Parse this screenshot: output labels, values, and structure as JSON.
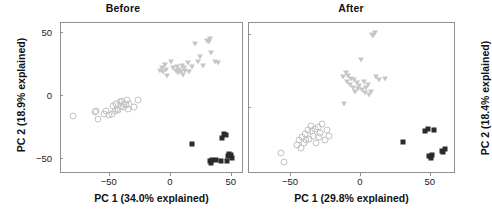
{
  "figure": {
    "width": 492,
    "height": 222,
    "background": "#ffffff",
    "marker_colors": {
      "circle_stroke": "#c2c2c2",
      "triangle_fill": "#c6c6c6",
      "square_fill": "#2b2b2b",
      "axis_line": "#8e8e8e",
      "text": "#111111"
    }
  },
  "chart_data": [
    {
      "type": "scatter",
      "title": "Before",
      "xlabel": "PC 1 (34.0% explained)",
      "ylabel": "PC 2 (18.9% explained)",
      "xlim": [
        -90,
        60
      ],
      "ylim": [
        -62,
        58
      ],
      "xticks": [
        -50,
        0,
        50
      ],
      "xticklabels": [
        "−50",
        "0",
        "50"
      ],
      "yticks": [
        -50,
        0,
        50
      ],
      "yticklabels": [
        "−50",
        "0",
        "50"
      ],
      "grid": false,
      "legend": "none",
      "series": [
        {
          "name": "group-circle",
          "marker": "circle-open",
          "color": "#c2c2c2",
          "points": [
            [
              -80,
              -16
            ],
            [
              -62,
              -13
            ],
            [
              -61,
              -12
            ],
            [
              -60,
              -18
            ],
            [
              -55,
              -14
            ],
            [
              -53,
              -12
            ],
            [
              -51,
              -15
            ],
            [
              -48,
              -14
            ],
            [
              -47,
              -8
            ],
            [
              -46,
              -12
            ],
            [
              -45,
              -6
            ],
            [
              -44,
              -10
            ],
            [
              -43,
              -11
            ],
            [
              -42,
              -5
            ],
            [
              -41,
              -8
            ],
            [
              -40,
              -4
            ],
            [
              -39,
              -9
            ],
            [
              -38,
              -6
            ],
            [
              -37,
              -7
            ],
            [
              -36,
              -3
            ],
            [
              -35,
              -10
            ],
            [
              -34,
              -6
            ],
            [
              -30,
              -9
            ],
            [
              -27,
              -3
            ]
          ]
        },
        {
          "name": "group-triangle",
          "marker": "triangle-down",
          "color": "#c6c6c6",
          "points": [
            [
              -9,
              20
            ],
            [
              -7,
              22
            ],
            [
              -6,
              19
            ],
            [
              -5,
              25
            ],
            [
              -4,
              21
            ],
            [
              -3,
              16
            ],
            [
              0,
              27
            ],
            [
              2,
              22
            ],
            [
              4,
              20
            ],
            [
              5,
              23
            ],
            [
              6,
              18
            ],
            [
              7,
              21
            ],
            [
              8,
              19
            ],
            [
              9,
              24
            ],
            [
              10,
              17
            ],
            [
              11,
              22
            ],
            [
              12,
              20
            ],
            [
              14,
              26
            ],
            [
              15,
              19
            ],
            [
              17,
              23
            ],
            [
              20,
              41
            ],
            [
              22,
              27
            ],
            [
              24,
              31
            ],
            [
              26,
              24
            ],
            [
              30,
              44
            ],
            [
              31,
              43
            ],
            [
              32,
              45
            ],
            [
              33,
              34
            ],
            [
              36,
              27
            ],
            [
              39,
              26
            ]
          ]
        },
        {
          "name": "group-square",
          "marker": "square-filled",
          "color": "#2b2b2b",
          "points": [
            [
              17,
              -38
            ],
            [
              32,
              -52
            ],
            [
              33,
              -53
            ],
            [
              34,
              -51
            ],
            [
              37,
              -51
            ],
            [
              41,
              -52
            ],
            [
              42,
              -33
            ],
            [
              44,
              -30
            ],
            [
              45,
              -31
            ],
            [
              46,
              -52
            ],
            [
              47,
              -48
            ],
            [
              48,
              -46
            ],
            [
              49,
              -47
            ],
            [
              50,
              -49
            ]
          ]
        }
      ]
    },
    {
      "type": "scatter",
      "title": "After",
      "xlabel": "PC 1 (29.8% explained)",
      "ylabel": "PC 2 (18.4% explained)",
      "xlim": [
        -80,
        68
      ],
      "ylim": [
        -45,
        58
      ],
      "xticks": [
        -50,
        0,
        50
      ],
      "xticklabels": [
        "−50",
        "0",
        "50"
      ],
      "yticks": [
        -50,
        0,
        50
      ],
      "yticklabels": [],
      "grid": false,
      "legend": "none",
      "series": [
        {
          "name": "group-circle",
          "marker": "circle-open",
          "color": "#c2c2c2",
          "points": [
            [
              -57,
              -31
            ],
            [
              -55,
              -37
            ],
            [
              -46,
              -25
            ],
            [
              -44,
              -22
            ],
            [
              -43,
              -27
            ],
            [
              -42,
              -20
            ],
            [
              -41,
              -24
            ],
            [
              -40,
              -18
            ],
            [
              -39,
              -22
            ],
            [
              -38,
              -15
            ],
            [
              -37,
              -21
            ],
            [
              -36,
              -12
            ],
            [
              -35,
              -16
            ],
            [
              -34,
              -19
            ],
            [
              -33,
              -14
            ],
            [
              -32,
              -24
            ],
            [
              -31,
              -13
            ],
            [
              -30,
              -20
            ],
            [
              -29,
              -17
            ],
            [
              -28,
              -11
            ],
            [
              -26,
              -22
            ],
            [
              -24,
              -15
            ],
            [
              -23,
              -19
            ]
          ]
        },
        {
          "name": "group-triangle",
          "marker": "triangle-down",
          "color": "#c6c6c6",
          "points": [
            [
              -13,
              21
            ],
            [
              -12,
              3
            ],
            [
              -11,
              24
            ],
            [
              -10,
              18
            ],
            [
              -9,
              22
            ],
            [
              -8,
              16
            ],
            [
              -7,
              20
            ],
            [
              -6,
              14
            ],
            [
              -5,
              19
            ],
            [
              -4,
              11
            ],
            [
              -3,
              17
            ],
            [
              -2,
              13
            ],
            [
              -1,
              15
            ],
            [
              0,
              33
            ],
            [
              1,
              12
            ],
            [
              2,
              18
            ],
            [
              3,
              10
            ],
            [
              4,
              14
            ],
            [
              5,
              16
            ],
            [
              6,
              9
            ],
            [
              7,
              11
            ],
            [
              8,
              50
            ],
            [
              9,
              49
            ],
            [
              10,
              51
            ],
            [
              11,
              21
            ],
            [
              13,
              19
            ],
            [
              17,
              20
            ]
          ]
        },
        {
          "name": "group-square",
          "marker": "square-filled",
          "color": "#2b2b2b",
          "points": [
            [
              30,
              -23
            ],
            [
              46,
              -16
            ],
            [
              48,
              -14
            ],
            [
              49,
              -33
            ],
            [
              50,
              -34
            ],
            [
              51,
              -32
            ],
            [
              52,
              -15
            ],
            [
              58,
              -29
            ],
            [
              59,
              -30
            ],
            [
              60,
              -28
            ]
          ]
        }
      ]
    }
  ]
}
